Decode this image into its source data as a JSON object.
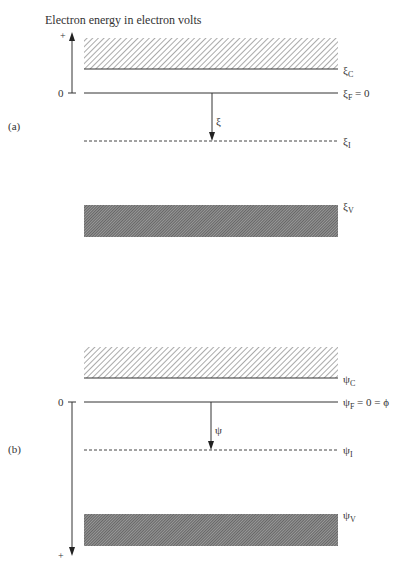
{
  "title": "Electron energy in electron volts",
  "panels": [
    {
      "id": "a",
      "label": "(a)",
      "axis": {
        "plus": "+",
        "zero": "0",
        "direction": "up"
      },
      "conduction_band_label": "ξ",
      "conduction_band_sub": "C",
      "fermi_label": "ξ",
      "fermi_sub": "F",
      "fermi_suffix": " = 0",
      "intrinsic_label": "ξ",
      "intrinsic_sub": "I",
      "valence_label": "ξ",
      "valence_sub": "V",
      "arrow_label": "ξ"
    },
    {
      "id": "b",
      "label": "(b)",
      "axis": {
        "plus": "+",
        "zero": "0",
        "direction": "down"
      },
      "conduction_band_label": "ψ",
      "conduction_band_sub": "C",
      "fermi_label": "ψ",
      "fermi_sub": "F",
      "fermi_suffix": " = 0 = ϕ",
      "intrinsic_label": "ψ",
      "intrinsic_sub": "I",
      "valence_label": "ψ",
      "valence_sub": "V",
      "arrow_label": "ψ"
    }
  ],
  "colors": {
    "line": "#333333",
    "hatch": "#555555",
    "dense_hatch": "#444444"
  }
}
